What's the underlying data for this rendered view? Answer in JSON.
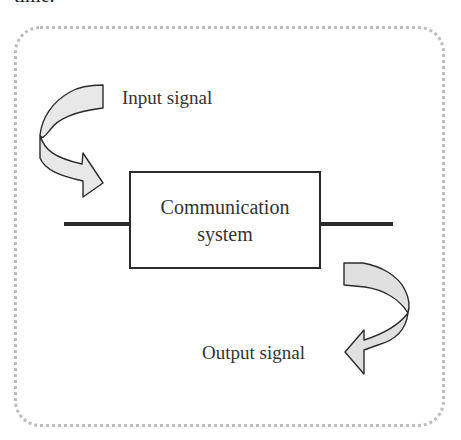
{
  "clipped_text": "time.",
  "diagram": {
    "box_label_line1": "Communication",
    "box_label_line2": "system",
    "input_label": "Input signal",
    "output_label": "Output signal",
    "arrow_fill": "#e8e8e8",
    "stroke_color": "#2b2b2b",
    "frame_color": "#bdbdbd"
  }
}
